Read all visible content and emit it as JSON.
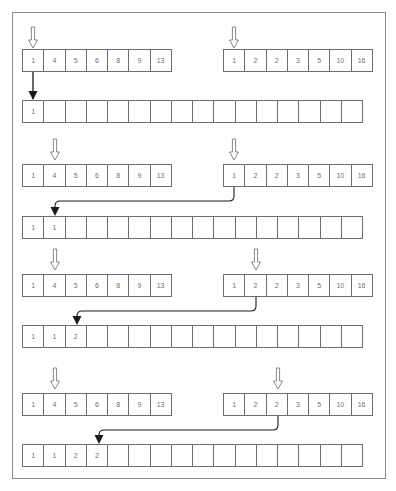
{
  "diagram": {
    "colors": {
      "border": "#6e6e6e",
      "text": "#707070",
      "arrow": "#1a1a1a",
      "pointer": "#777777",
      "frame": "#8a8a8a"
    },
    "merged_length": 16,
    "steps": [
      {
        "left": {
          "values": [
            "1",
            "4",
            "5",
            "6",
            "8",
            "9",
            "13"
          ],
          "pointer_index": 0
        },
        "right": {
          "values": [
            "1",
            "2",
            "2",
            "3",
            "5",
            "10",
            "16"
          ],
          "pointer_index": 0
        },
        "merged": [
          "1",
          "",
          "",
          "",
          "",
          "",
          "",
          "",
          "",
          "",
          "",
          "",
          "",
          "",
          "",
          ""
        ],
        "move": {
          "from": "left",
          "from_index": 0,
          "to_index": 0
        }
      },
      {
        "left": {
          "values": [
            "1",
            "4",
            "5",
            "6",
            "8",
            "9",
            "13"
          ],
          "pointer_index": 1
        },
        "right": {
          "values": [
            "1",
            "2",
            "2",
            "3",
            "5",
            "10",
            "16"
          ],
          "pointer_index": 0
        },
        "merged": [
          "1",
          "1",
          "",
          "",
          "",
          "",
          "",
          "",
          "",
          "",
          "",
          "",
          "",
          "",
          "",
          ""
        ],
        "move": {
          "from": "right",
          "from_index": 0,
          "to_index": 1
        }
      },
      {
        "left": {
          "values": [
            "1",
            "4",
            "5",
            "6",
            "8",
            "9",
            "13"
          ],
          "pointer_index": 1
        },
        "right": {
          "values": [
            "1",
            "2",
            "2",
            "3",
            "5",
            "10",
            "16"
          ],
          "pointer_index": 1
        },
        "merged": [
          "1",
          "1",
          "2",
          "",
          "",
          "",
          "",
          "",
          "",
          "",
          "",
          "",
          "",
          "",
          "",
          ""
        ],
        "move": {
          "from": "right",
          "from_index": 1,
          "to_index": 2
        }
      },
      {
        "left": {
          "values": [
            "1",
            "4",
            "5",
            "6",
            "8",
            "9",
            "13"
          ],
          "pointer_index": 1
        },
        "right": {
          "values": [
            "1",
            "2",
            "2",
            "3",
            "5",
            "10",
            "16"
          ],
          "pointer_index": 2
        },
        "merged": [
          "1",
          "1",
          "2",
          "2",
          "",
          "",
          "",
          "",
          "",
          "",
          "",
          "",
          "",
          "",
          "",
          ""
        ],
        "move": {
          "from": "right",
          "from_index": 2,
          "to_index": 3
        }
      }
    ]
  }
}
